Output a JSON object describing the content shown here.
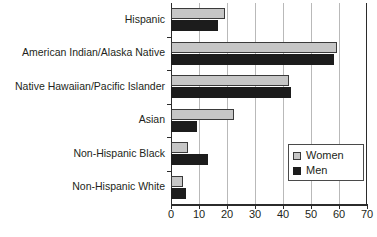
{
  "chart_data": {
    "type": "bar",
    "orientation": "horizontal",
    "title": "",
    "subtitle": "",
    "xlabel": "",
    "ylabel": "",
    "xlim": [
      0,
      70
    ],
    "xticks": [
      0,
      10,
      20,
      30,
      40,
      50,
      60,
      70
    ],
    "xtick_labels": [
      "0",
      "10",
      "20",
      "30",
      "40",
      "50",
      "60",
      "70"
    ],
    "grid": "vertical",
    "legend_position": "middle-right",
    "categories": [
      "Hispanic",
      "American Indian/Alaska Native",
      "Native Hawaiian/Pacific Islander",
      "Asian",
      "Non-Hispanic Black",
      "Non-Hispanic White"
    ],
    "series": [
      {
        "name": "Women",
        "color": "#c6c6c6",
        "values": [
          19.3,
          59.3,
          42.0,
          22.4,
          6.0,
          4.2
        ]
      },
      {
        "name": "Men",
        "color": "#1c1c1c",
        "values": [
          16.8,
          58.2,
          43.0,
          9.2,
          13.2,
          5.2
        ]
      }
    ]
  },
  "legend": {
    "items": [
      {
        "label": "Women",
        "swatch": "women"
      },
      {
        "label": "Men",
        "swatch": "men"
      }
    ]
  }
}
